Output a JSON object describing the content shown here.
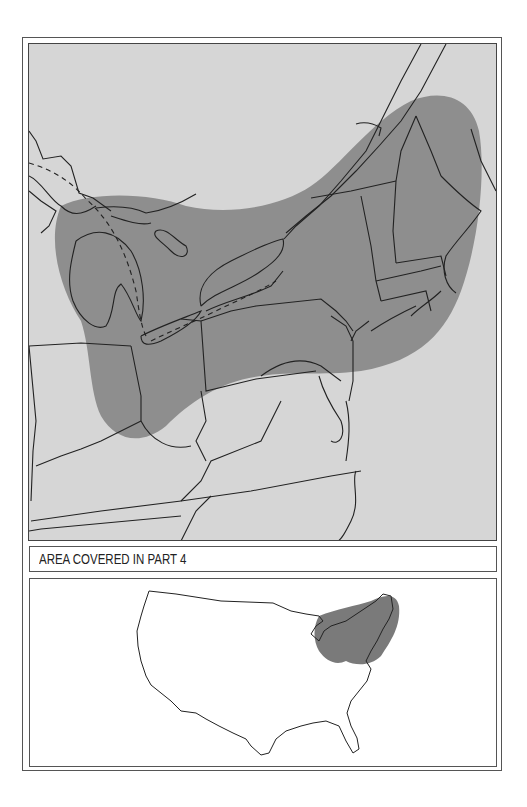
{
  "figure": {
    "main_map": {
      "description": "Regional map of the northeastern United States and Great Lakes area with shaded coverage region",
      "colors": {
        "background": "#d6d6d6",
        "shaded_region": "#8e8e8e",
        "lines": "#222222"
      }
    },
    "caption": {
      "label": "AREA COVERED IN PART 4"
    },
    "inset_map": {
      "description": "Outline map of the contiguous United States with the northeastern coverage area shaded",
      "colors": {
        "background": "#ffffff",
        "shaded_region": "#7a7a7a",
        "lines": "#222222"
      }
    }
  }
}
